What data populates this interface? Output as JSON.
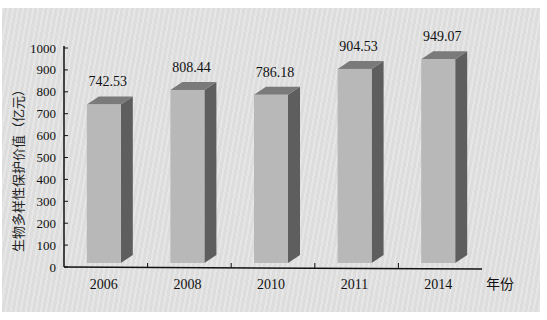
{
  "chart_data": {
    "type": "bar",
    "title": "",
    "categories": [
      "2006",
      "2008",
      "2010",
      "2011",
      "2014"
    ],
    "values": [
      742.53,
      808.44,
      786.18,
      904.53,
      949.07
    ],
    "value_labels": [
      "742.53",
      "808.44",
      "786.18",
      "904.53",
      "949.07"
    ],
    "xlabel": "年份",
    "ylabel": "生物多样性保护价值（亿元）",
    "ylim": [
      0,
      1000
    ],
    "yticks": [
      0,
      100,
      200,
      300,
      400,
      500,
      600,
      700,
      800,
      900,
      1000
    ],
    "grid": false,
    "legend": null,
    "style": "3d-column",
    "colors": {
      "front": "#b8b8b8",
      "top": "#7a7a7a",
      "side": "#5e5e5e",
      "background": "#e4e4e4",
      "axis": "#111111"
    }
  }
}
